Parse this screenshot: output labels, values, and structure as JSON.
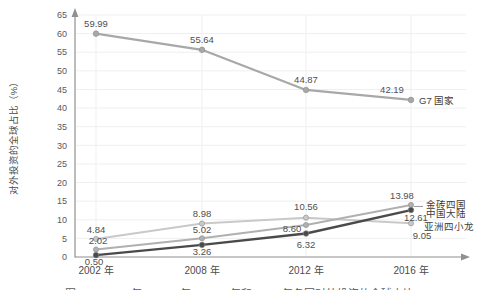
{
  "figure": {
    "caption_partial": "图 2-11 2002 年、2008 年、2012 年和 2016 年各国对外投资的全球占比"
  },
  "chart_data": {
    "type": "line",
    "title": "",
    "ylabel": "对外投资的全球占比（%）",
    "categories": [
      "2002 年",
      "2008 年",
      "2012 年",
      "2016 年"
    ],
    "ylim": [
      0,
      65
    ],
    "ytick_step": 5,
    "grid": true,
    "legend_position": "labels-at-line-end",
    "series": [
      {
        "name": "G7 国家",
        "values": [
          59.99,
          55.64,
          44.87,
          42.19
        ],
        "color": "#a8a8a8"
      },
      {
        "name": "金砖四国",
        "values": [
          2.02,
          5.02,
          8.6,
          13.98
        ],
        "color": "#b0b0b0"
      },
      {
        "name": "中国大陆",
        "values": [
          0.5,
          3.26,
          6.32,
          12.61
        ],
        "color": "#4a4a4a"
      },
      {
        "name": "亚洲四小龙",
        "values": [
          4.84,
          8.98,
          10.56,
          9.05
        ],
        "color": "#c9c9c9"
      }
    ],
    "axis_color": "#909090",
    "gridline_color": "#efefef"
  }
}
